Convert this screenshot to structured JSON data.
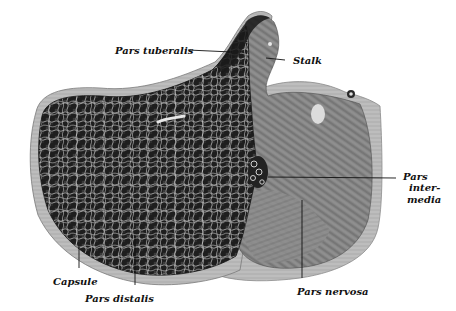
{
  "figure": {
    "colors": {
      "background": "#ffffff",
      "pars_distalis_dark": "#1c1c1c",
      "pars_distalis_light": "#9a9a9a",
      "pars_nervosa": "#7a7a7a",
      "capsule": "#b8b8b8",
      "leader_line": "#111111",
      "label_text": "#111111"
    }
  },
  "labels": {
    "pars_tuberalis": "Pars tuberalis",
    "stalk": "Stalk",
    "pars_intermedia_1": "Pars",
    "pars_intermedia_2": "inter-",
    "pars_intermedia_3": "media",
    "capsule": "Capsule",
    "pars_distalis": "Pars distalis",
    "pars_nervosa": "Pars nervosa"
  }
}
